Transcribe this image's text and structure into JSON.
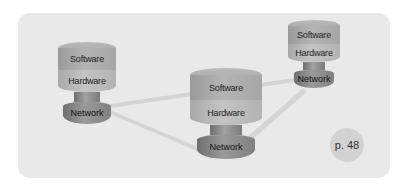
{
  "diagram": {
    "type": "network-topology",
    "nodes": [
      {
        "id": "left",
        "layers": {
          "software": "Software",
          "hardware": "Hardware",
          "network": "Network"
        }
      },
      {
        "id": "center",
        "layers": {
          "software": "Software",
          "hardware": "Hardware",
          "network": "Network"
        }
      },
      {
        "id": "right",
        "layers": {
          "software": "Software",
          "hardware": "Hardware",
          "network": "Network"
        }
      }
    ],
    "links": [
      {
        "from": "left.network",
        "to": "center.software"
      },
      {
        "from": "left.network",
        "to": "center.network"
      },
      {
        "from": "center.software",
        "to": "right.network"
      },
      {
        "from": "center.network",
        "to": "right.network"
      }
    ]
  },
  "page_badge": "p. 48",
  "colors": {
    "panel": "#e9e9e9",
    "link": "#d6d6d6",
    "badge": "#d2d2d2"
  }
}
